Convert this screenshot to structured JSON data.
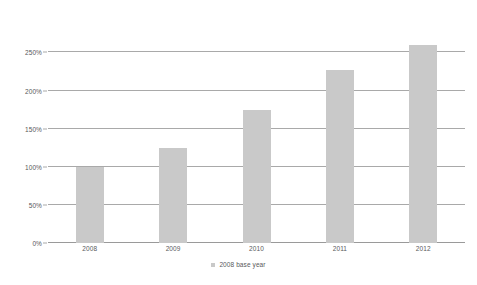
{
  "chart_data": {
    "type": "bar",
    "title": "",
    "subtitle": "",
    "xlabel": "",
    "ylabel": "",
    "categories": [
      "2008",
      "2009",
      "2010",
      "2011",
      "2012"
    ],
    "values": [
      100,
      125,
      175,
      227,
      260
    ],
    "value_unit": "%",
    "ylim": [
      0,
      250
    ],
    "ytick_values": [
      0,
      50,
      100,
      150,
      200,
      250
    ],
    "ytick_labels": [
      "0%",
      "50%",
      "100%",
      "150%",
      "200%",
      "250%"
    ],
    "grid": true,
    "grid_axis": "y",
    "legend": {
      "position": "bottom-center",
      "entries": [
        {
          "label": "2008 base year",
          "marker": "square",
          "color": "#c9c9c9"
        }
      ]
    },
    "series": [
      {
        "name": "2008 base year",
        "color": "#c9c9c9",
        "values": [
          100,
          125,
          175,
          227,
          260
        ]
      }
    ],
    "colors": {
      "bar": "#c9c9c9",
      "gridline": "#a9a9a9",
      "axis_text": "#58595b",
      "background": "#ffffff"
    }
  }
}
